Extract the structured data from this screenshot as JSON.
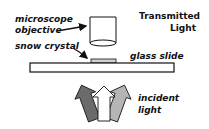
{
  "labels": {
    "title_line1": "Transmitted",
    "title_line2": "Light",
    "objective_line1": "microscope",
    "objective_line2": "objective",
    "crystal": "snow crystal",
    "slide": "glass slide",
    "incident_line1": "incident",
    "incident_line2": "light"
  },
  "colors": {
    "stroke": "#111111",
    "crystal_fill": "#d0d0d0",
    "arrow_left": "#6b6b6b",
    "arrow_center": "#ffffff",
    "arrow_right": "#b5b5b5"
  }
}
